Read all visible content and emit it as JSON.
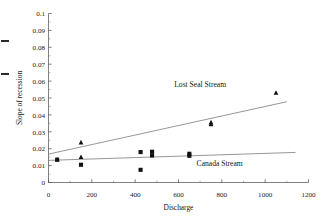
{
  "chart_data": {
    "type": "scatter",
    "title": "",
    "xlabel": "Discharge",
    "ylabel": "Slope of recession",
    "xlim": [
      0,
      1200
    ],
    "ylim": [
      0,
      0.1
    ],
    "grid": false,
    "legend_position": "inline-annotation",
    "x_ticks": [
      0,
      200,
      400,
      600,
      800,
      1000,
      1200
    ],
    "x_tick_labels": [
      "0",
      "200",
      "400",
      "600",
      "800",
      "1000",
      "1200"
    ],
    "x_minor_ticks": [
      100,
      300,
      500,
      700,
      900,
      1100
    ],
    "y_ticks": [
      0,
      0.01,
      0.02,
      0.03,
      0.04,
      0.05,
      0.06,
      0.07,
      0.08,
      0.09,
      0.1
    ],
    "y_tick_labels": [
      "0",
      "0.01",
      "0.02",
      "0.03",
      "0.04",
      "0.05",
      "0.06",
      "0.07",
      "0.08",
      "0.09",
      "0.1"
    ],
    "series": [
      {
        "name": "Lost Seal Stream",
        "marker": "triangle",
        "color": "#111111",
        "annotation": "Lost Seal Stream",
        "points": [
          {
            "x": 40,
            "y": 0.0135
          },
          {
            "x": 150,
            "y": 0.0237
          },
          {
            "x": 150,
            "y": 0.015
          },
          {
            "x": 750,
            "y": 0.0355
          },
          {
            "x": 750,
            "y": 0.0345
          },
          {
            "x": 1050,
            "y": 0.053
          }
        ],
        "trendline": {
          "x0": 0,
          "y0": 0.0168,
          "x1": 1100,
          "y1": 0.0478
        }
      },
      {
        "name": "Canada Stream",
        "marker": "square",
        "color": "#111111",
        "annotation": "Canada Stream",
        "points": [
          {
            "x": 40,
            "y": 0.0135
          },
          {
            "x": 150,
            "y": 0.0105
          },
          {
            "x": 425,
            "y": 0.018
          },
          {
            "x": 425,
            "y": 0.0075
          },
          {
            "x": 478,
            "y": 0.0182
          },
          {
            "x": 478,
            "y": 0.016
          },
          {
            "x": 650,
            "y": 0.017
          },
          {
            "x": 650,
            "y": 0.0158
          }
        ],
        "trendline": {
          "x0": 0,
          "y0": 0.0131,
          "x1": 1140,
          "y1": 0.0178
        }
      }
    ],
    "annotations": [
      {
        "text": "Lost Seal Stream",
        "x": 700,
        "y": 0.0565
      },
      {
        "text": "Canada Stream",
        "x": 790,
        "y": 0.0098
      }
    ]
  },
  "axes": {
    "x_title": "Discharge",
    "y_title": "Slope of recession",
    "y_labels": {
      "t0": "0",
      "t1": "0.01",
      "t2": "0.02",
      "t3": "0.03",
      "t4": "0.04",
      "t5": "0.05",
      "t6": "0.06",
      "t7": "0.07",
      "t8": "0.08",
      "t9": "0.09",
      "t10": "0.1"
    },
    "x_labels": {
      "t0": "0",
      "t1": "200",
      "t2": "400",
      "t3": "600",
      "t4": "800",
      "t5": "1000",
      "t6": "1200"
    }
  },
  "labels": {
    "lost_seal": "Lost Seal Stream",
    "canada": "Canada Stream"
  }
}
